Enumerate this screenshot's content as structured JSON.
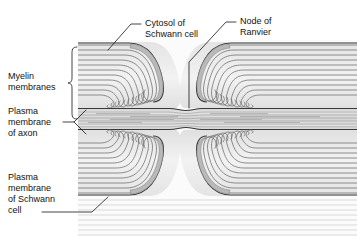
{
  "figure": {
    "style": "grayscale electron micrograph tracing",
    "background_color": "#ffffff",
    "ink_color": "#121212",
    "labels": {
      "cytosol": {
        "line1": "Cytosol of",
        "line2": "Schwann cell"
      },
      "node": {
        "line1": "Node of",
        "line2": "Ranvier"
      },
      "myelin": {
        "line1": "Myelin",
        "line2": "membranes"
      },
      "axon_membrane": {
        "line1": "Plasma",
        "line2": "membrane",
        "line3": "of axon"
      },
      "schwann_membrane": {
        "line1": "Plasma",
        "line2": "membrane",
        "line3": "of Schwann",
        "line4": "cell"
      }
    },
    "structures": {
      "myelin_lamellae_per_quadrant": 11,
      "node_gap_label": "node gap",
      "axon_label": "axon",
      "paranodal_loops_label": "paranodal terminal loops"
    },
    "palette": {
      "lamella_line": "#6f6f6f",
      "lamella_dark": "#4a4a4a",
      "cytoplasm_fill": "#c9c9c9",
      "myelin_fill": "#ededed",
      "axon_fill": "#dcdcdc",
      "axon_striation": "#8d8d8d",
      "outer_tissue": "#e8e8e8"
    }
  }
}
